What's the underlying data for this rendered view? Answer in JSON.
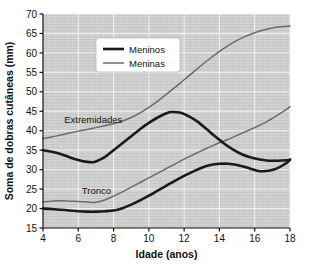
{
  "chart_data": {
    "type": "line",
    "title": "",
    "xlabel": "Idade (anos)",
    "ylabel": "Soma de dobras cutâneas (mm)",
    "xlim": [
      4,
      18
    ],
    "ylim": [
      15,
      70
    ],
    "xticks": [
      4,
      6,
      8,
      10,
      12,
      14,
      16,
      18
    ],
    "yticks": [
      15,
      20,
      25,
      30,
      35,
      40,
      45,
      50,
      55,
      60,
      65,
      70
    ],
    "grid": true,
    "legend_position": "top-center",
    "legend": [
      {
        "name": "Meninos",
        "color": "#1a1a1a",
        "width": 2.6
      },
      {
        "name": "Meninas",
        "color": "#6b6b6b",
        "width": 1.5
      }
    ],
    "annotations": [
      {
        "text": "Extremidades",
        "x": 5.2,
        "y": 43.0
      },
      {
        "text": "Tronco",
        "x": 6.2,
        "y": 24.6
      }
    ],
    "series": [
      {
        "name": "Meninos - Extremidades",
        "group": "Extremidades",
        "legend": "Meninos",
        "color": "#1a1a1a",
        "width": 2.6,
        "x": [
          4,
          4.5,
          5,
          5.5,
          6,
          6.5,
          6.8,
          7,
          7.5,
          8,
          8.5,
          9,
          9.5,
          10,
          10.5,
          11,
          11.3,
          11.8,
          12.3,
          12.8,
          13.3,
          13.8,
          14.3,
          14.8,
          15.3,
          15.8,
          16.3,
          16.8,
          17.3,
          17.8,
          18
        ],
        "y": [
          35.0,
          34.6,
          34.0,
          33.2,
          32.5,
          32.0,
          31.9,
          32.1,
          33.2,
          35.0,
          36.8,
          38.6,
          40.4,
          42.0,
          43.4,
          44.5,
          44.8,
          44.6,
          43.6,
          42.2,
          40.3,
          38.4,
          36.6,
          35.1,
          33.9,
          33.1,
          32.6,
          32.3,
          32.3,
          32.4,
          32.5
        ]
      },
      {
        "name": "Meninas - Extremidades",
        "group": "Extremidades",
        "legend": "Meninas",
        "color": "#6b6b6b",
        "width": 1.5,
        "x": [
          4,
          4.5,
          5,
          5.5,
          6,
          6.5,
          7,
          7.5,
          8,
          8.5,
          9,
          9.5,
          10,
          10.5,
          11,
          11.5,
          12,
          12.5,
          13,
          13.5,
          14,
          14.5,
          15,
          15.5,
          16,
          16.5,
          17,
          17.5,
          18
        ],
        "y": [
          38.0,
          38.4,
          38.9,
          39.4,
          39.9,
          40.3,
          40.8,
          41.3,
          41.8,
          42.5,
          43.4,
          44.6,
          46.0,
          47.6,
          49.4,
          51.2,
          53.1,
          55.0,
          56.9,
          58.7,
          60.4,
          61.9,
          63.2,
          64.3,
          65.2,
          65.9,
          66.4,
          66.7,
          66.9
        ]
      },
      {
        "name": "Meninos - Tronco",
        "group": "Tronco",
        "legend": "Meninos",
        "color": "#1a1a1a",
        "width": 2.6,
        "x": [
          4,
          4.5,
          5,
          5.5,
          6,
          6.5,
          7,
          7.5,
          8,
          8.5,
          9,
          9.5,
          10,
          10.5,
          11,
          11.5,
          12,
          12.5,
          13,
          13.5,
          14,
          14.5,
          15,
          15.5,
          16,
          16.3,
          16.8,
          17.3,
          17.8,
          18
        ],
        "y": [
          20.0,
          19.9,
          19.7,
          19.5,
          19.3,
          19.2,
          19.2,
          19.3,
          19.5,
          20.1,
          21.0,
          22.1,
          23.3,
          24.6,
          25.9,
          27.2,
          28.4,
          29.5,
          30.5,
          31.2,
          31.5,
          31.5,
          31.2,
          30.6,
          29.9,
          29.6,
          29.7,
          30.4,
          31.7,
          32.6
        ]
      },
      {
        "name": "Meninas - Tronco",
        "group": "Tronco",
        "legend": "Meninas",
        "color": "#6b6b6b",
        "width": 1.5,
        "x": [
          4,
          4.5,
          5,
          5.5,
          6,
          6.5,
          7,
          7.5,
          8,
          8.5,
          9,
          9.5,
          10,
          10.5,
          11,
          11.5,
          12,
          12.5,
          13,
          13.5,
          14,
          14.5,
          15,
          15.5,
          16,
          16.5,
          17,
          17.5,
          18
        ],
        "y": [
          21.7,
          21.9,
          22.0,
          21.9,
          21.8,
          21.7,
          21.6,
          22.2,
          23.2,
          24.3,
          25.5,
          26.7,
          27.9,
          29.1,
          30.3,
          31.5,
          32.7,
          33.8,
          34.9,
          35.9,
          36.9,
          37.8,
          38.8,
          39.8,
          40.8,
          41.9,
          43.2,
          44.6,
          46.2
        ]
      }
    ]
  }
}
